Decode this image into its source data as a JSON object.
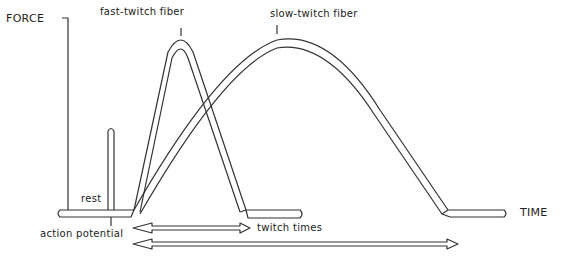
{
  "diagram": {
    "axis_y_label": "FORCE",
    "axis_x_label": "TIME",
    "labels": {
      "fast": "fast-twitch fiber",
      "slow": "slow-twitch fiber",
      "rest": "rest",
      "action_potential": "action potential",
      "twitch_times": "twitch times"
    }
  }
}
